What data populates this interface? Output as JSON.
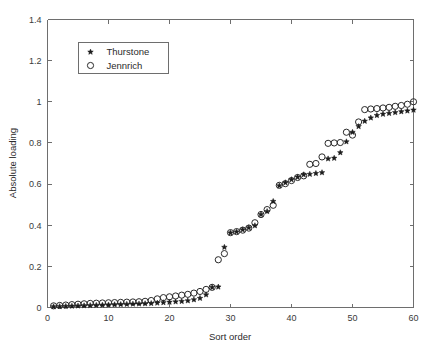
{
  "chart_data": {
    "type": "scatter",
    "title": "",
    "xlabel": "Sort order",
    "ylabel": "Absolute loading",
    "xlim": [
      0,
      60
    ],
    "ylim": [
      0,
      1.4
    ],
    "xticks": [
      0,
      10,
      20,
      30,
      40,
      50,
      60
    ],
    "xtick_labels": [
      "0",
      "10",
      "20",
      "30",
      "40",
      "50",
      "60"
    ],
    "yticks": [
      0,
      0.2,
      0.4,
      0.6,
      0.8,
      1,
      1.2,
      1.4
    ],
    "ytick_labels": [
      "0",
      "0.2",
      "0.4",
      "0.6",
      "0.8",
      "1",
      "1.2",
      "1.4"
    ],
    "grid": false,
    "legend_position": "upper left",
    "x": [
      1,
      2,
      3,
      4,
      5,
      6,
      7,
      8,
      9,
      10,
      11,
      12,
      13,
      14,
      15,
      16,
      17,
      18,
      19,
      20,
      21,
      22,
      23,
      24,
      25,
      26,
      27,
      28,
      29,
      30,
      31,
      32,
      33,
      34,
      35,
      36,
      37,
      38,
      39,
      40,
      41,
      42,
      43,
      44,
      45,
      46,
      47,
      48,
      49,
      50,
      51,
      52,
      53,
      54,
      55,
      56,
      57,
      58,
      59,
      60
    ],
    "series": [
      {
        "name": "Thurstone",
        "marker": "star",
        "color": "#1c1c1c",
        "values": [
          0.004,
          0.005,
          0.006,
          0.007,
          0.008,
          0.009,
          0.01,
          0.011,
          0.012,
          0.013,
          0.014,
          0.015,
          0.016,
          0.017,
          0.018,
          0.019,
          0.02,
          0.022,
          0.024,
          0.026,
          0.028,
          0.03,
          0.033,
          0.038,
          0.045,
          0.062,
          0.098,
          0.1,
          0.293,
          0.363,
          0.368,
          0.378,
          0.388,
          0.398,
          0.452,
          0.467,
          0.516,
          0.592,
          0.607,
          0.622,
          0.634,
          0.646,
          0.648,
          0.652,
          0.656,
          0.723,
          0.726,
          0.753,
          0.806,
          0.852,
          0.88,
          0.906,
          0.922,
          0.934,
          0.94,
          0.944,
          0.948,
          0.952,
          0.956,
          0.96
        ]
      },
      {
        "name": "Jennrich",
        "marker": "circle",
        "color": "#2a2a2a",
        "values": [
          0.008,
          0.01,
          0.012,
          0.014,
          0.016,
          0.018,
          0.02,
          0.021,
          0.022,
          0.023,
          0.024,
          0.025,
          0.026,
          0.027,
          0.028,
          0.03,
          0.034,
          0.042,
          0.048,
          0.052,
          0.056,
          0.06,
          0.064,
          0.07,
          0.078,
          0.088,
          0.098,
          0.232,
          0.262,
          0.364,
          0.369,
          0.376,
          0.386,
          0.412,
          0.452,
          0.476,
          0.497,
          0.594,
          0.602,
          0.617,
          0.632,
          0.64,
          0.696,
          0.7,
          0.732,
          0.798,
          0.8,
          0.802,
          0.852,
          0.838,
          0.902,
          0.962,
          0.965,
          0.967,
          0.97,
          0.973,
          0.978,
          0.982,
          0.988,
          1.0
        ]
      }
    ]
  },
  "legend": {
    "entries": [
      {
        "label": "Thurstone",
        "marker": "star-marker"
      },
      {
        "label": "Jennrich",
        "marker": "circle-marker"
      }
    ]
  }
}
